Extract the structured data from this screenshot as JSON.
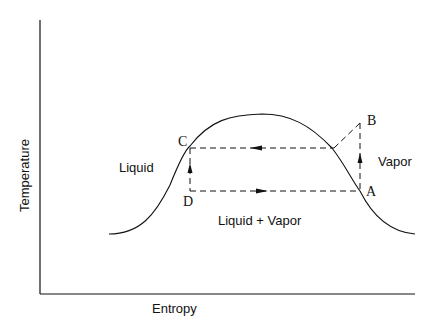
{
  "diagram": {
    "axes": {
      "xlabel": "Entropy",
      "ylabel": "Temperature"
    },
    "regions": {
      "liquid": "Liquid",
      "vapor": "Vapor",
      "mixture": "Liquid + Vapor"
    },
    "points": {
      "a": "A",
      "b": "B",
      "c": "C",
      "d": "D"
    },
    "colors": {
      "line": "#111111",
      "background": "#ffffff"
    }
  }
}
